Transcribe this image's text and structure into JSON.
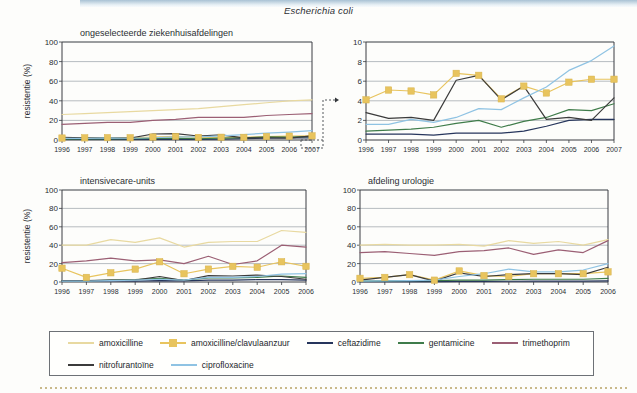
{
  "figure": {
    "title": "Escherichia coli",
    "y_axis_label": "resistentie (%)"
  },
  "legend": {
    "items": [
      {
        "label": "amoxicilline",
        "color": "#e8d9a0",
        "marker": "none"
      },
      {
        "label": "amoxicilline/clavulaanzuur",
        "color": "#e8c45e",
        "marker": "square"
      },
      {
        "label": "ceftazidime",
        "color": "#26355c",
        "marker": "none"
      },
      {
        "label": "gentamicine",
        "color": "#3f7c4a",
        "marker": "none"
      },
      {
        "label": "trimethoprim",
        "color": "#9b5f74",
        "marker": "none"
      },
      {
        "label": "nitrofurantoïne",
        "color": "#3b3b3b",
        "marker": "none"
      },
      {
        "label": "ciprofloxacine",
        "color": "#8fc3e3",
        "marker": "none"
      }
    ],
    "rows": [
      [
        0,
        1,
        2,
        3,
        4
      ],
      [
        5,
        6
      ]
    ]
  },
  "callout": {
    "description": "dashed-callout-from-lower-left-panel-to-zoom-panel",
    "arrow": "→"
  },
  "chart_data": [
    {
      "id": "ongeselecteerde-ziekenhuisafdelingen",
      "type": "line",
      "title": "ongeselecteerde ziekenhuisafdelingen",
      "xlabel": "",
      "ylabel": "resistentie (%)",
      "ylim": [
        0,
        100
      ],
      "yticks": [
        0,
        20,
        40,
        60,
        80,
        100
      ],
      "grid": true,
      "legend_position": "below-figure",
      "categories": [
        "1996",
        "1997",
        "1998",
        "1999",
        "2000",
        "2001",
        "2002",
        "2003",
        "2004",
        "2005",
        "2006",
        "2007"
      ],
      "series": [
        {
          "name": "amoxicilline",
          "color": "#e8d9a0",
          "marker": "none",
          "values": [
            26,
            27,
            28,
            29,
            30,
            31,
            32,
            34,
            36,
            38,
            40,
            41
          ]
        },
        {
          "name": "amoxicilline/clavulaanzuur",
          "color": "#e8c45e",
          "marker": "square",
          "values": [
            2.0,
            2.2,
            2.4,
            2.3,
            3.0,
            3.6,
            2.6,
            2.8,
            2.7,
            3.5,
            3.9,
            4.2
          ]
        },
        {
          "name": "ceftazidime",
          "color": "#26355c",
          "marker": "none",
          "values": [
            0.6,
            0.6,
            0.6,
            0.5,
            0.7,
            0.7,
            0.7,
            0.9,
            1.4,
            2.0,
            2.1,
            2.1
          ]
        },
        {
          "name": "gentamicine",
          "color": "#3f7c4a",
          "marker": "none",
          "values": [
            0.9,
            1.0,
            1.1,
            1.3,
            1.7,
            2.0,
            1.3,
            1.9,
            2.3,
            3.1,
            3.0,
            3.7
          ]
        },
        {
          "name": "trimethoprim",
          "color": "#9b5f74",
          "marker": "none",
          "values": [
            16,
            17,
            18,
            18,
            20,
            21,
            23,
            23,
            23,
            25,
            26,
            27
          ]
        },
        {
          "name": "nitrofurantoïne",
          "color": "#3b3b3b",
          "marker": "none",
          "values": [
            2.8,
            2.2,
            2.3,
            2.0,
            6.1,
            6.6,
            4.1,
            5.3,
            2.1,
            2.3,
            2.0,
            4.3
          ]
        },
        {
          "name": "ciprofloxacine",
          "color": "#8fc3e3",
          "marker": "none",
          "values": [
            1.6,
            1.6,
            2.1,
            1.8,
            2.3,
            3.2,
            3.1,
            4.3,
            5.4,
            7.1,
            8.1,
            9.6
          ]
        }
      ]
    },
    {
      "id": "zoom-0-10-percent",
      "type": "line",
      "title": "",
      "xlabel": "",
      "ylabel": "",
      "ylim": [
        0,
        10
      ],
      "yticks": [
        0,
        2,
        4,
        6,
        8,
        10
      ],
      "grid": true,
      "legend_position": "below-figure",
      "categories": [
        "1996",
        "1997",
        "1998",
        "1999",
        "2000",
        "2001",
        "2002",
        "2003",
        "2004",
        "2005",
        "2006",
        "2007"
      ],
      "series": [
        {
          "name": "amoxicilline/clavulaanzuur",
          "color": "#e8c45e",
          "marker": "square",
          "values": [
            4.1,
            5.1,
            5.0,
            4.6,
            6.8,
            6.6,
            4.2,
            5.5,
            4.8,
            5.9,
            6.2,
            6.2
          ]
        },
        {
          "name": "ceftazidime",
          "color": "#26355c",
          "marker": "none",
          "values": [
            0.6,
            0.6,
            0.6,
            0.5,
            0.7,
            0.7,
            0.7,
            0.9,
            1.4,
            2.0,
            2.1,
            2.1
          ]
        },
        {
          "name": "gentamicine",
          "color": "#3f7c4a",
          "marker": "none",
          "values": [
            0.9,
            1.0,
            1.1,
            1.3,
            1.7,
            2.0,
            1.3,
            1.9,
            2.3,
            3.1,
            3.0,
            3.7
          ]
        },
        {
          "name": "nitrofurantoïne",
          "color": "#3b3b3b",
          "marker": "none",
          "values": [
            2.8,
            2.2,
            2.3,
            2.0,
            6.1,
            6.6,
            4.1,
            5.5,
            2.1,
            2.3,
            2.0,
            4.3
          ]
        },
        {
          "name": "ciprofloxacine",
          "color": "#8fc3e3",
          "marker": "none",
          "values": [
            1.6,
            1.6,
            2.1,
            1.8,
            2.3,
            3.2,
            3.1,
            4.3,
            5.4,
            7.1,
            8.1,
            9.6
          ]
        }
      ]
    },
    {
      "id": "intensivecare-units",
      "type": "line",
      "title": "intensivecare-units",
      "xlabel": "",
      "ylabel": "resistentie (%)",
      "ylim": [
        0,
        100
      ],
      "yticks": [
        0,
        20,
        40,
        60,
        80,
        100
      ],
      "grid": true,
      "legend_position": "below-figure",
      "categories": [
        "1996",
        "1997",
        "1998",
        "1999",
        "2000",
        "2001",
        "2002",
        "2003",
        "2004",
        "2005",
        "2006"
      ],
      "series": [
        {
          "name": "amoxicilline",
          "color": "#e8d9a0",
          "marker": "none",
          "values": [
            40,
            40,
            46,
            43,
            48,
            38,
            43,
            44,
            44,
            56,
            54
          ]
        },
        {
          "name": "amoxicilline/clavulaanzuur",
          "color": "#e8c45e",
          "marker": "square",
          "values": [
            15,
            5,
            10,
            14,
            22,
            9,
            14,
            17,
            16,
            22,
            17
          ]
        },
        {
          "name": "ceftazidime",
          "color": "#26355c",
          "marker": "none",
          "values": [
            1.0,
            1.0,
            1.2,
            1.0,
            1.5,
            1.2,
            2.0,
            2.0,
            2.5,
            2.5,
            2.0
          ]
        },
        {
          "name": "gentamicine",
          "color": "#3f7c4a",
          "marker": "none",
          "values": [
            1.5,
            1.2,
            2.0,
            2.5,
            4.0,
            2.0,
            4.5,
            4.5,
            5.0,
            6.5,
            5.0
          ]
        },
        {
          "name": "trimethoprim",
          "color": "#9b5f74",
          "marker": "none",
          "values": [
            21,
            23,
            26,
            23,
            24,
            20,
            28,
            19,
            23,
            40,
            38
          ]
        },
        {
          "name": "nitrofurantoïne",
          "color": "#3b3b3b",
          "marker": "none",
          "values": [
            1.5,
            1.5,
            2.0,
            2.0,
            6.0,
            1.5,
            7.0,
            6.5,
            7.5,
            6.0,
            3.0
          ]
        },
        {
          "name": "ciprofloxacine",
          "color": "#8fc3e3",
          "marker": "none",
          "values": [
            1.0,
            1.0,
            1.5,
            2.0,
            3.0,
            2.0,
            5.0,
            5.0,
            6.0,
            8.5,
            9.0
          ]
        }
      ]
    },
    {
      "id": "afdeling-urologie",
      "type": "line",
      "title": "afdeling urologie",
      "xlabel": "",
      "ylabel": "",
      "ylim": [
        0,
        100
      ],
      "yticks": [
        0,
        20,
        40,
        60,
        80,
        100
      ],
      "grid": true,
      "legend_position": "below-figure",
      "categories": [
        "1996",
        "1997",
        "1998",
        "1999",
        "2000",
        "2001",
        "2002",
        "2003",
        "2004",
        "2005",
        "2006"
      ],
      "series": [
        {
          "name": "amoxicilline",
          "color": "#e8d9a0",
          "marker": "none",
          "values": [
            40,
            41,
            40,
            40,
            41,
            39,
            45,
            42,
            44,
            40,
            46
          ]
        },
        {
          "name": "amoxicilline/clavulaanzuur",
          "color": "#e8c45e",
          "marker": "square",
          "values": [
            4,
            5,
            8,
            2,
            12,
            7,
            6,
            9,
            9,
            9,
            11
          ]
        },
        {
          "name": "ceftazidime",
          "color": "#26355c",
          "marker": "none",
          "values": [
            0.5,
            0.5,
            0.5,
            0.5,
            0.7,
            0.7,
            0.8,
            1.0,
            1.0,
            1.0,
            1.2
          ]
        },
        {
          "name": "gentamicine",
          "color": "#3f7c4a",
          "marker": "none",
          "values": [
            1.0,
            1.2,
            1.5,
            1.5,
            2.0,
            2.0,
            2.5,
            3.0,
            3.0,
            3.0,
            4.0
          ]
        },
        {
          "name": "trimethoprim",
          "color": "#9b5f74",
          "marker": "none",
          "values": [
            32,
            33,
            31,
            29,
            33,
            34,
            37,
            30,
            35,
            32,
            45
          ]
        },
        {
          "name": "nitrofurantoïne",
          "color": "#3b3b3b",
          "marker": "none",
          "values": [
            2,
            5,
            8,
            1,
            10,
            6,
            8,
            9,
            9,
            8,
            16
          ]
        },
        {
          "name": "ciprofloxacine",
          "color": "#8fc3e3",
          "marker": "none",
          "values": [
            1.0,
            1.2,
            1.5,
            2.0,
            6.0,
            9.0,
            14.0,
            11.0,
            11.0,
            13.0,
            20.0
          ]
        }
      ]
    }
  ]
}
